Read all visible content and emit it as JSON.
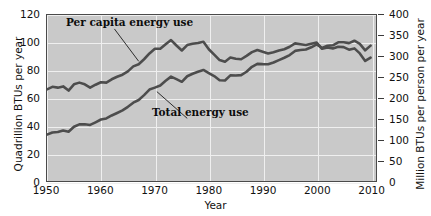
{
  "chart_data": {
    "type": "line",
    "title": "",
    "xlabel": "Year",
    "ylabel": "Quadrillion BTUs per year",
    "y2label": "Million BTUs per person per year",
    "xlim": [
      1950,
      2011
    ],
    "ylim": [
      0,
      120
    ],
    "y2lim": [
      0,
      400
    ],
    "grid": true,
    "legend_position": "inline-annotations",
    "xticks": [
      "1950",
      "1960",
      "1970",
      "1980",
      "1990",
      "2000",
      "2010"
    ],
    "xtick_values": [
      1950,
      1960,
      1970,
      1980,
      1990,
      2000,
      2010
    ],
    "yticks": [
      "0",
      "20",
      "40",
      "60",
      "80",
      "100",
      "120"
    ],
    "ytick_values": [
      0,
      20,
      40,
      60,
      80,
      100,
      120
    ],
    "y2ticks": [
      "0",
      "50",
      "100",
      "150",
      "200",
      "250",
      "300",
      "350",
      "400"
    ],
    "y2tick_values": [
      0,
      50,
      100,
      150,
      200,
      250,
      300,
      350,
      400
    ],
    "series": [
      {
        "name": "Per capita energy use",
        "axis": "right",
        "units": "Million BTUs per person per year",
        "color": "#4d4d4d",
        "x": [
          1950,
          1951,
          1952,
          1953,
          1954,
          1955,
          1956,
          1957,
          1958,
          1959,
          1960,
          1961,
          1962,
          1963,
          1964,
          1965,
          1966,
          1967,
          1968,
          1969,
          1970,
          1971,
          1972,
          1973,
          1974,
          1975,
          1976,
          1977,
          1978,
          1979,
          1980,
          1981,
          1982,
          1983,
          1984,
          1985,
          1986,
          1987,
          1988,
          1989,
          1990,
          1991,
          1992,
          1993,
          1994,
          1995,
          1996,
          1997,
          1998,
          1999,
          2000,
          2001,
          2002,
          2003,
          2004,
          2005,
          2006,
          2007,
          2008,
          2009,
          2010
        ],
        "values": [
          222,
          228,
          226,
          229,
          219,
          234,
          238,
          234,
          226,
          233,
          239,
          238,
          246,
          252,
          257,
          265,
          277,
          282,
          294,
          308,
          319,
          319,
          330,
          340,
          327,
          315,
          328,
          331,
          333,
          336,
          318,
          305,
          292,
          288,
          298,
          295,
          294,
          302,
          311,
          316,
          312,
          308,
          311,
          315,
          318,
          324,
          332,
          330,
          328,
          331,
          334,
          319,
          322,
          320,
          324,
          323,
          317,
          320,
          308,
          290,
          298
        ]
      },
      {
        "name": "Total energy use",
        "axis": "left",
        "units": "Quadrillion BTUs per year",
        "color": "#4d4d4d",
        "x": [
          1950,
          1951,
          1952,
          1953,
          1954,
          1955,
          1956,
          1957,
          1958,
          1959,
          1960,
          1961,
          1962,
          1963,
          1964,
          1965,
          1966,
          1967,
          1968,
          1969,
          1970,
          1971,
          1972,
          1973,
          1974,
          1975,
          1976,
          1977,
          1978,
          1979,
          1980,
          1981,
          1982,
          1983,
          1984,
          1985,
          1986,
          1987,
          1988,
          1989,
          1990,
          1991,
          1992,
          1993,
          1994,
          1995,
          1996,
          1997,
          1998,
          1999,
          2000,
          2001,
          2002,
          2003,
          2004,
          2005,
          2006,
          2007,
          2008,
          2009,
          2010
        ],
        "values": [
          34.0,
          35.6,
          35.9,
          37.0,
          36.1,
          39.7,
          41.4,
          41.5,
          41.0,
          42.9,
          44.9,
          45.7,
          47.8,
          49.6,
          51.5,
          54.0,
          57.0,
          58.9,
          62.4,
          66.4,
          67.8,
          69.3,
          72.7,
          75.7,
          73.9,
          72.0,
          76.0,
          77.8,
          79.2,
          80.5,
          78.3,
          76.1,
          73.1,
          72.9,
          76.6,
          76.5,
          76.8,
          79.2,
          82.8,
          84.9,
          84.7,
          84.6,
          85.9,
          87.6,
          89.3,
          91.2,
          94.2,
          94.8,
          95.2,
          96.8,
          98.9,
          96.3,
          97.9,
          98.2,
          100.4,
          100.4,
          99.8,
          101.5,
          99.3,
          94.6,
          98.0
        ]
      }
    ],
    "annotations": [
      {
        "text": "Per capita energy use",
        "points_to_year": 1967,
        "points_to_value": 282
      },
      {
        "text": "Total energy use",
        "points_to_year": 1970,
        "points_to_value": 67.8
      }
    ],
    "colors": {
      "plot_background": "#c9c9c9",
      "gridline": "#efefef",
      "axis": "#3a3a3a",
      "line": "#4d4d4d",
      "text": "#111111"
    }
  }
}
